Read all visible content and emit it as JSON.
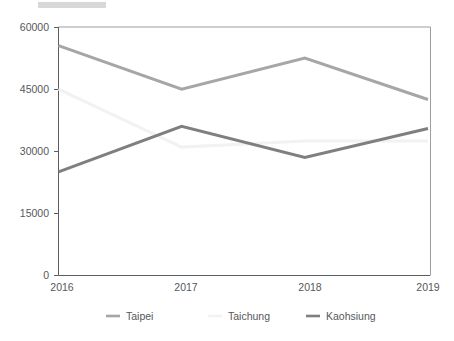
{
  "chart_data": {
    "type": "line",
    "title": "",
    "xlabel": "",
    "ylabel": "",
    "categories": [
      "2016",
      "2017",
      "2018",
      "2019"
    ],
    "x_tick_labels": [
      "2016",
      "2017",
      "2018",
      "2019"
    ],
    "y_tick_labels": [
      "0",
      "15000",
      "30000",
      "45000",
      "60000"
    ],
    "y_ticks": [
      0,
      15000,
      30000,
      45000,
      60000
    ],
    "ylim": [
      0,
      60000
    ],
    "xlim": [
      "2016",
      "2019"
    ],
    "grid": false,
    "legend_position": "bottom",
    "series": [
      {
        "name": "Taipei",
        "color": "#a6a6a6",
        "values": [
          55500,
          45000,
          52500,
          42500
        ]
      },
      {
        "name": "Taichung",
        "color": "#f2f2f2",
        "values": [
          45000,
          31000,
          32500,
          32500
        ]
      },
      {
        "name": "Kaohsiung",
        "color": "#7f7f7f",
        "values": [
          25000,
          36000,
          28500,
          35500
        ]
      }
    ]
  },
  "legend": {
    "items": [
      {
        "label": "Taipei",
        "color": "#a6a6a6"
      },
      {
        "label": "Taichung",
        "color": "#f2f2f2"
      },
      {
        "label": "Kaohsiung",
        "color": "#7f7f7f"
      }
    ]
  },
  "axes": {
    "y_labels": [
      "60000",
      "45000",
      "30000",
      "15000",
      "0"
    ],
    "x_labels": [
      "2016",
      "2017",
      "2018",
      "2019"
    ]
  }
}
